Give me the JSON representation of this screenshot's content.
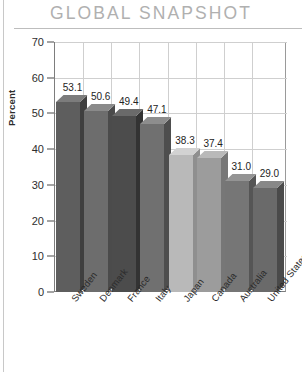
{
  "header": {
    "title": "GLOBAL SNAPSHOT"
  },
  "chart_data": {
    "type": "bar",
    "title": "GLOBAL SNAPSHOT",
    "xlabel": "",
    "ylabel": "Percent",
    "ylim": [
      0,
      70
    ],
    "ytick_labels": [
      "0",
      "10",
      "20",
      "30",
      "40",
      "50",
      "60",
      "70"
    ],
    "ytick_values": [
      0,
      10,
      20,
      30,
      40,
      50,
      60,
      70
    ],
    "grid": true,
    "legend": "none",
    "categories": [
      "Sweden",
      "Denmark",
      "France",
      "Italy",
      "Japan",
      "Canada",
      "Australia",
      "United States"
    ],
    "values": [
      53.1,
      50.6,
      49.4,
      47.1,
      38.3,
      37.4,
      31.0,
      29.0
    ],
    "value_labels": [
      "53.1",
      "50.6",
      "49.4",
      "47.1",
      "38.3",
      "37.4",
      "31.0",
      "29.0"
    ],
    "bar_colors": [
      "#5e5e5e",
      "#6d6d6d",
      "#4c4c4c",
      "#707070",
      "#b9b9b9",
      "#9c9c9c",
      "#767676",
      "#6a6a6a"
    ],
    "bar_top_colors": [
      "#7c7c7c",
      "#8a8a8a",
      "#6a6a6a",
      "#8d8d8d",
      "#d2d2d2",
      "#b9b9b9",
      "#949494",
      "#888888"
    ],
    "bar_side_colors": [
      "#3f3f3f",
      "#4b4b4b",
      "#333333",
      "#4e4e4e",
      "#8f8f8f",
      "#777777",
      "#555555",
      "#4a4a4a"
    ]
  }
}
